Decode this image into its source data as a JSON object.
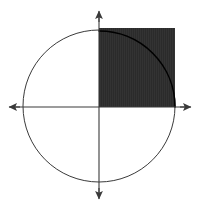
{
  "figure": {
    "background_color": "#ffffff",
    "width": 199,
    "height": 207
  },
  "chart_data": {
    "type": "scatter",
    "title": "Unit circle with inscribed first-quadrant square",
    "xlabel": "",
    "ylabel": "",
    "xlim": [
      -1.2,
      1.2
    ],
    "ylim": [
      -1.25,
      1.25
    ],
    "grid": false,
    "legend": null,
    "origin_px": {
      "x": 99,
      "y": 107
    },
    "unit_px": 76,
    "shapes": [
      {
        "name": "circle",
        "kind": "circle",
        "center": [
          0,
          0
        ],
        "radius": 1,
        "center_px": [
          99,
          106
        ],
        "radius_px": 76,
        "stroke": "#3a3a3a",
        "stroke_width": 1,
        "fill": "none"
      },
      {
        "name": "shaded-square",
        "kind": "rect",
        "corner_min": [
          0,
          0
        ],
        "corner_max": [
          1,
          1
        ],
        "x_px": 99,
        "y_px": 28,
        "width_px": 76,
        "height_px": 79,
        "fill": "#2b2b2b",
        "stroke": "none"
      },
      {
        "name": "quarter-arc-overlay",
        "kind": "arc",
        "center": [
          0,
          0
        ],
        "radius": 1,
        "start_angle_deg": 0,
        "end_angle_deg": 90,
        "stroke": "#000000",
        "stroke_width": 1.6,
        "fill": "none"
      }
    ],
    "axes": [
      {
        "name": "x-axis",
        "from": [
          -1.2,
          0
        ],
        "to": [
          1.24,
          0
        ],
        "from_px": [
          8,
          107
        ],
        "to_px": [
          193,
          107
        ],
        "arrow_start": true,
        "arrow_end": true,
        "stroke": "#3a3a3a"
      },
      {
        "name": "y-axis",
        "from": [
          0,
          1.26
        ],
        "to": [
          0,
          -1.22
        ],
        "from_px": [
          99,
          10
        ],
        "to_px": [
          99,
          200
        ],
        "arrow_start": true,
        "arrow_end": true,
        "stroke": "#3a3a3a"
      }
    ],
    "tick_labels": {
      "x": [],
      "y": []
    },
    "annotations": [],
    "colors": {
      "shade": "#2b2b2b",
      "circle_stroke": "#3a3a3a",
      "axis_stroke": "#3a3a3a",
      "arc_stroke": "#000000",
      "background": "#ffffff"
    }
  }
}
